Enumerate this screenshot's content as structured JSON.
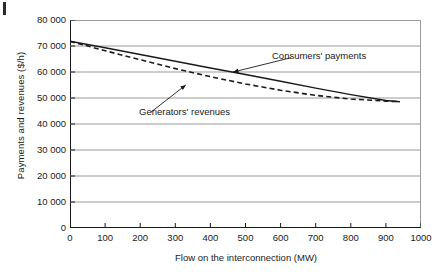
{
  "figure": {
    "page_mark": "",
    "x_axis_title": "Flow on the interconnection (MW)",
    "y_axis_title": "Payments and revenues ($/h)",
    "annotations": {
      "consumers": "Consumers' payments",
      "generators": "Generators' revenues"
    }
  },
  "chart_data": {
    "type": "line",
    "title": "",
    "xlabel": "Flow on the interconnection (MW)",
    "ylabel": "Payments and revenues ($/h)",
    "xlim": [
      0,
      1000
    ],
    "ylim": [
      0,
      80000
    ],
    "xticks": [
      0,
      100,
      200,
      300,
      400,
      500,
      600,
      700,
      800,
      900,
      1000
    ],
    "yticks": [
      0,
      10000,
      20000,
      30000,
      40000,
      50000,
      60000,
      70000,
      80000
    ],
    "xtick_labels": [
      "0",
      "100",
      "200",
      "300",
      "400",
      "500",
      "600",
      "700",
      "800",
      "900",
      "1000"
    ],
    "ytick_labels": [
      "0",
      "10 000",
      "20 000",
      "30 000",
      "40 000",
      "50 000",
      "60 000",
      "70 000",
      "80 000"
    ],
    "grid": "horizontal",
    "legend_position": "inline-annotations",
    "colors": {
      "axis": "#1a1a1a",
      "grid": "#9a9a9a",
      "consumers": "#1a1a1a",
      "generators": "#1a1a1a"
    },
    "series": [
      {
        "name": "Consumers' payments",
        "style": "solid",
        "x": [
          0,
          100,
          200,
          300,
          400,
          500,
          600,
          700,
          800,
          900,
          940
        ],
        "values": [
          71800,
          69300,
          66700,
          64100,
          61500,
          59000,
          56400,
          53800,
          51300,
          49000,
          48600
        ]
      },
      {
        "name": "Generators' revenues",
        "style": "dashed",
        "x": [
          0,
          100,
          200,
          300,
          400,
          500,
          600,
          700,
          800,
          900,
          940
        ],
        "values": [
          71800,
          68200,
          64700,
          61300,
          58200,
          55400,
          53000,
          51000,
          49600,
          48800,
          48600
        ]
      }
    ],
    "annotations": [
      {
        "text": "Consumers' payments",
        "target_x": 465,
        "target_y": 60000,
        "text_x": 630,
        "text_y": 65500
      },
      {
        "text": "Generators' revenues",
        "target_x": 330,
        "target_y": 55000,
        "text_x": 230,
        "text_y": 44500
      }
    ]
  }
}
